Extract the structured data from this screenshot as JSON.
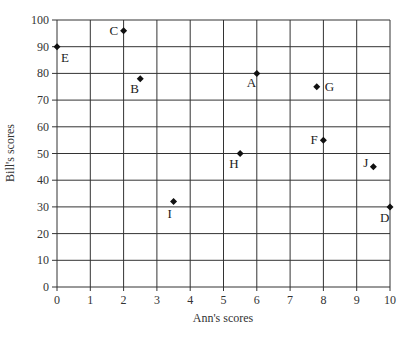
{
  "chart_data": {
    "type": "scatter",
    "title": "",
    "xlabel": "Ann's scores",
    "ylabel": "Bill's scores",
    "xlim": [
      0,
      10
    ],
    "ylim": [
      0,
      100
    ],
    "xticks": [
      0,
      1,
      2,
      3,
      4,
      5,
      6,
      7,
      8,
      9,
      10
    ],
    "yticks": [
      0,
      10,
      20,
      30,
      40,
      50,
      60,
      70,
      80,
      90,
      100
    ],
    "grid": true,
    "legend": null,
    "points": [
      {
        "label": "A",
        "x": 6,
        "y": 80,
        "lx": -10,
        "ly": 14
      },
      {
        "label": "B",
        "x": 2.5,
        "y": 78,
        "lx": -10,
        "ly": 14
      },
      {
        "label": "C",
        "x": 2,
        "y": 96,
        "lx": -14,
        "ly": 4
      },
      {
        "label": "D",
        "x": 10,
        "y": 30,
        "lx": -10,
        "ly": 15
      },
      {
        "label": "E",
        "x": 0,
        "y": 90,
        "lx": 4,
        "ly": 15
      },
      {
        "label": "F",
        "x": 8,
        "y": 55,
        "lx": -13,
        "ly": 4
      },
      {
        "label": "G",
        "x": 7.8,
        "y": 75,
        "lx": 8,
        "ly": 4
      },
      {
        "label": "H",
        "x": 5.5,
        "y": 50,
        "lx": -11,
        "ly": 14
      },
      {
        "label": "I",
        "x": 3.5,
        "y": 32,
        "lx": -6,
        "ly": 16
      },
      {
        "label": "J",
        "x": 9.5,
        "y": 45,
        "lx": -10,
        "ly": 0
      }
    ]
  },
  "colors": {
    "grid": "#333333",
    "marker": "#111111",
    "text": "#333333"
  }
}
